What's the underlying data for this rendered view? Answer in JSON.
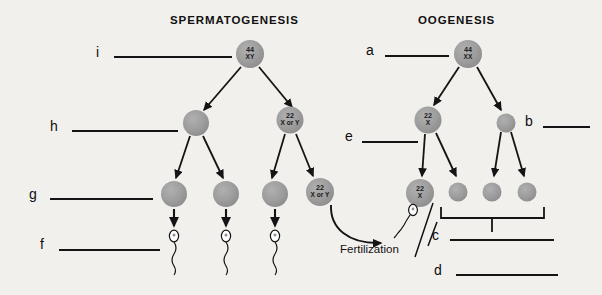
{
  "diagram": {
    "title_left": "SPERMATOGENESIS",
    "title_right": "OOGENESIS",
    "fertilization_label": "Fertilization",
    "background_color": "#f2f0ed",
    "cell_fill_color": "#9a9a9a",
    "line_color": "#141414"
  },
  "spermatogenesis": {
    "primary_cell": {
      "number": "44",
      "chromosomes": "XY"
    },
    "secondary_cells": [
      {
        "number": "",
        "chromosomes": ""
      },
      {
        "number": "22",
        "chromosomes": "X or Y"
      }
    ],
    "spermatid_cells": [
      {
        "number": "",
        "chromosomes": ""
      },
      {
        "number": "",
        "chromosomes": ""
      },
      {
        "number": "",
        "chromosomes": ""
      },
      {
        "number": "22",
        "chromosomes": "X or Y"
      }
    ],
    "sperm_count": 3
  },
  "oogenesis": {
    "primary_cell": {
      "number": "44",
      "chromosomes": "XX"
    },
    "secondary_cells": [
      {
        "number": "22",
        "chromosomes": "X"
      },
      {
        "number": "",
        "chromosomes": ""
      }
    ],
    "ovum_cell": {
      "number": "22",
      "chromosomes": "X"
    },
    "polar_body_count": 3
  },
  "answer_blanks": [
    {
      "id": "a",
      "letter": "a"
    },
    {
      "id": "b",
      "letter": "b"
    },
    {
      "id": "c",
      "letter": "c"
    },
    {
      "id": "d",
      "letter": "d"
    },
    {
      "id": "e",
      "letter": "e"
    },
    {
      "id": "f",
      "letter": "f"
    },
    {
      "id": "g",
      "letter": "g"
    },
    {
      "id": "h",
      "letter": "h"
    },
    {
      "id": "i",
      "letter": "i"
    }
  ]
}
